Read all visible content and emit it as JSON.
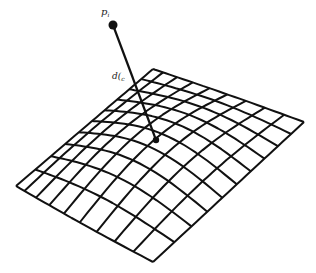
{
  "diagram": {
    "labels": {
      "point": "p",
      "point_sub": "i",
      "distance": "d(",
      "distance_sub": "c",
      "distance_sub2": "i"
    },
    "mesh": {
      "u_cells": 10,
      "v_cells": 9
    },
    "colors": {
      "stroke": "#111111",
      "background": "#ffffff"
    }
  }
}
